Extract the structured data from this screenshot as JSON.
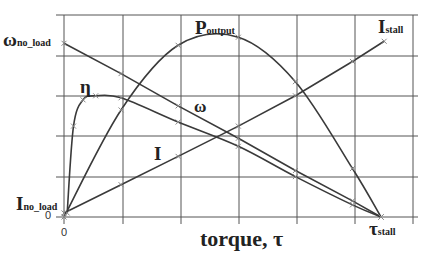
{
  "chart_data": {
    "type": "line",
    "title": "",
    "xlabel": "torque, τ",
    "ylabel": "",
    "x_ticks": [
      "0"
    ],
    "y_ticks": [
      "0"
    ],
    "grid": true,
    "xlim": [
      0,
      1.09
    ],
    "ylim": [
      0,
      1
    ],
    "x_note": "x normalized to stall torque (τ_stall = 1.0)",
    "annotations": {
      "omega_no_load": "ω",
      "omega_no_load_sub": "no_load",
      "i_no_load": "I",
      "i_no_load_sub": "no_load",
      "tau_stall": "τ",
      "tau_stall_sub": "stall",
      "i_stall": "I",
      "i_stall_sub": "stall",
      "p_output": "P",
      "p_output_sub": "output",
      "eta": "η",
      "omega": "ω",
      "current": "I"
    },
    "series": [
      {
        "name": "ω (speed)",
        "x": [
          0,
          0.18,
          0.36,
          0.55,
          0.73,
          0.91,
          1.0
        ],
        "y": [
          0.86,
          0.71,
          0.55,
          0.39,
          0.23,
          0.08,
          0.0
        ]
      },
      {
        "name": "P_output",
        "x": [
          0,
          0.18,
          0.36,
          0.55,
          0.73,
          0.91,
          1.0
        ],
        "y": [
          0.0,
          0.53,
          0.85,
          0.89,
          0.67,
          0.24,
          0.0
        ]
      },
      {
        "name": "η (efficiency)",
        "x": [
          0.01,
          0.03,
          0.06,
          0.1,
          0.18,
          0.36,
          0.55,
          0.73,
          0.91,
          1.0
        ],
        "y": [
          0.02,
          0.45,
          0.58,
          0.6,
          0.59,
          0.47,
          0.35,
          0.2,
          0.06,
          0.0
        ]
      },
      {
        "name": "I (current)",
        "x": [
          0,
          0.18,
          0.36,
          0.55,
          0.73,
          0.91,
          1.01
        ],
        "y": [
          0.02,
          0.16,
          0.3,
          0.45,
          0.6,
          0.77,
          0.87
        ]
      }
    ],
    "legend": "inline labels"
  }
}
